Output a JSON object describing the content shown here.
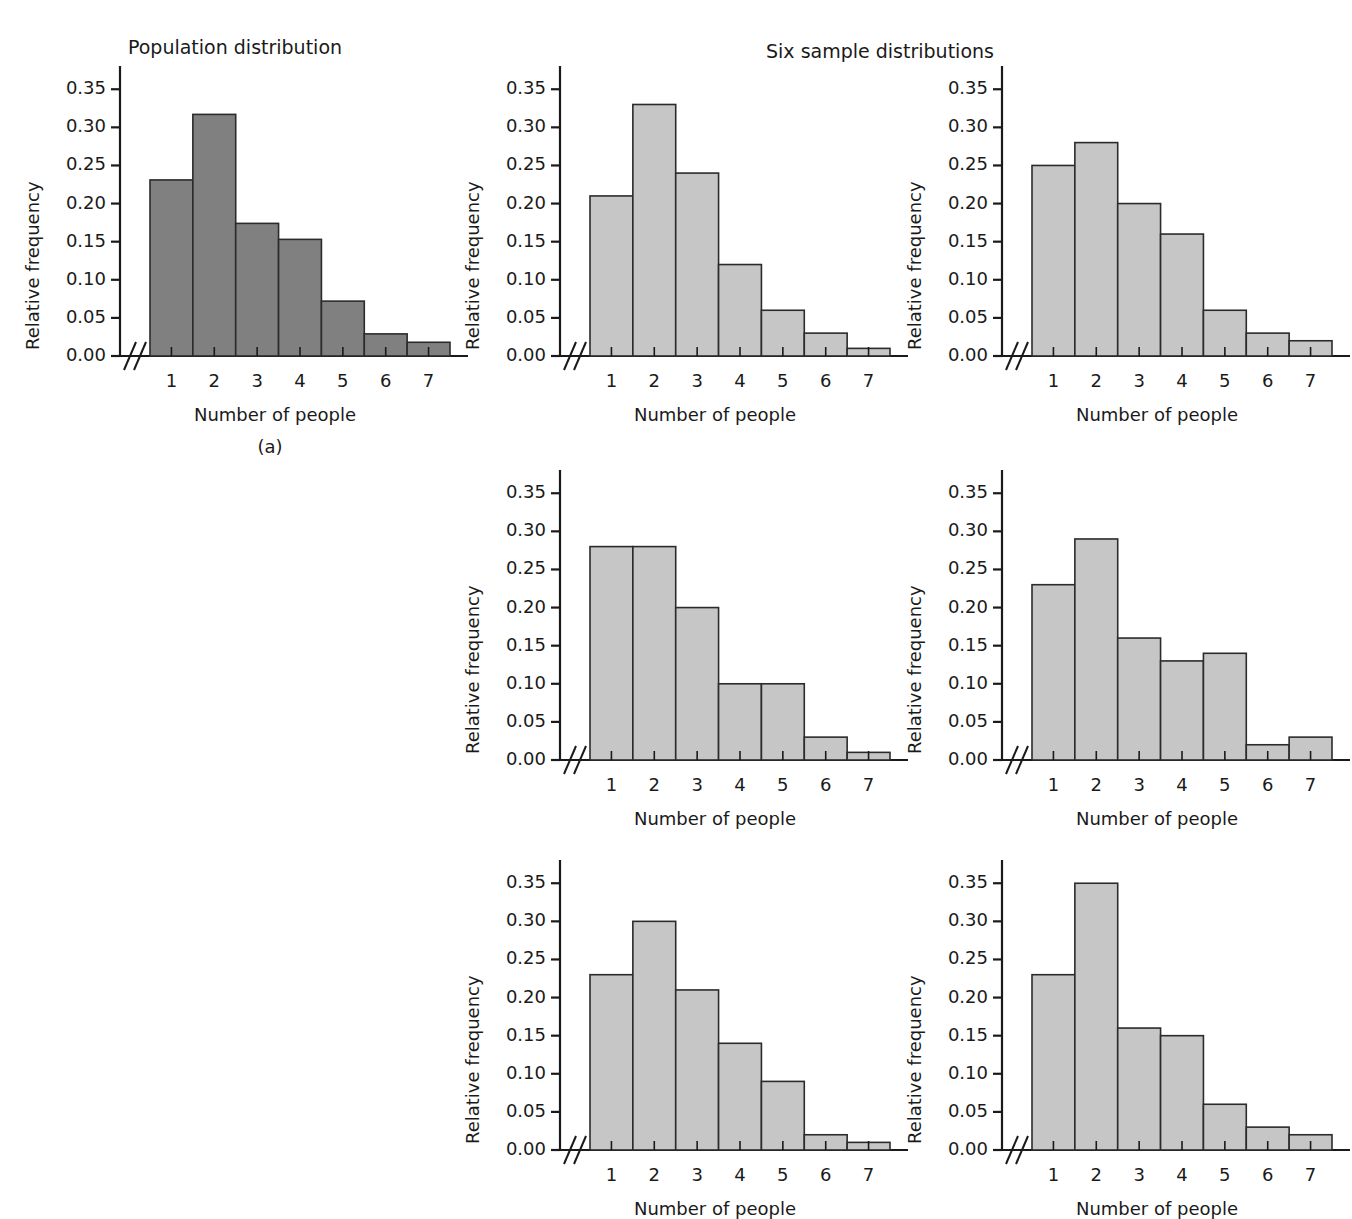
{
  "figure": {
    "caption_a": "(a)",
    "population_title": "Population distribution",
    "samples_title": "Six sample distributions"
  },
  "axis": {
    "xlabel": "Number of people",
    "ylabel": "Relative frequency",
    "ytick_labels": [
      "0.00",
      "0.05",
      "0.10",
      "0.15",
      "0.20",
      "0.25",
      "0.30",
      "0.35"
    ],
    "xtick_labels": [
      "1",
      "2",
      "3",
      "4",
      "5",
      "6",
      "7"
    ]
  },
  "colors": {
    "population_bar_fill": "#808080",
    "sample_bar_fill": "#c6c6c6",
    "bar_stroke": "#2b2b2b",
    "axis": "#1a1a1a",
    "text": "#1a1a1a"
  },
  "chart_data": [
    {
      "type": "bar",
      "name": "population-distribution",
      "title": "Population distribution",
      "xlabel": "Number of people",
      "ylabel": "Relative frequency",
      "categories": [
        "1",
        "2",
        "3",
        "4",
        "5",
        "6",
        "7"
      ],
      "values": [
        0.231,
        0.317,
        0.174,
        0.153,
        0.072,
        0.029,
        0.018
      ],
      "ylim": [
        0.0,
        0.37
      ],
      "yticks": [
        0.0,
        0.05,
        0.1,
        0.15,
        0.2,
        0.25,
        0.3,
        0.35
      ],
      "grid": false,
      "legend": "none",
      "axis_break": true,
      "bar_fill": "#808080"
    },
    {
      "type": "bar",
      "name": "sample-distribution-1",
      "title": "Six sample distributions",
      "xlabel": "Number of people",
      "ylabel": "Relative frequency",
      "categories": [
        "1",
        "2",
        "3",
        "4",
        "5",
        "6",
        "7"
      ],
      "values": [
        0.21,
        0.33,
        0.24,
        0.12,
        0.06,
        0.03,
        0.01
      ],
      "ylim": [
        0.0,
        0.37
      ],
      "yticks": [
        0.0,
        0.05,
        0.1,
        0.15,
        0.2,
        0.25,
        0.3,
        0.35
      ],
      "grid": false,
      "legend": "none",
      "axis_break": true,
      "bar_fill": "#c6c6c6"
    },
    {
      "type": "bar",
      "name": "sample-distribution-2",
      "title": "",
      "xlabel": "Number of people",
      "ylabel": "Relative frequency",
      "categories": [
        "1",
        "2",
        "3",
        "4",
        "5",
        "6",
        "7"
      ],
      "values": [
        0.25,
        0.28,
        0.2,
        0.16,
        0.06,
        0.03,
        0.02
      ],
      "ylim": [
        0.0,
        0.37
      ],
      "yticks": [
        0.0,
        0.05,
        0.1,
        0.15,
        0.2,
        0.25,
        0.3,
        0.35
      ],
      "grid": false,
      "legend": "none",
      "axis_break": true,
      "bar_fill": "#c6c6c6"
    },
    {
      "type": "bar",
      "name": "sample-distribution-3",
      "title": "",
      "xlabel": "Number of people",
      "ylabel": "Relative frequency",
      "categories": [
        "1",
        "2",
        "3",
        "4",
        "5",
        "6",
        "7"
      ],
      "values": [
        0.28,
        0.28,
        0.2,
        0.1,
        0.1,
        0.03,
        0.01
      ],
      "ylim": [
        0.0,
        0.37
      ],
      "yticks": [
        0.0,
        0.05,
        0.1,
        0.15,
        0.2,
        0.25,
        0.3,
        0.35
      ],
      "grid": false,
      "legend": "none",
      "axis_break": true,
      "bar_fill": "#c6c6c6"
    },
    {
      "type": "bar",
      "name": "sample-distribution-4",
      "title": "",
      "xlabel": "Number of people",
      "ylabel": "Relative frequency",
      "categories": [
        "1",
        "2",
        "3",
        "4",
        "5",
        "6",
        "7"
      ],
      "values": [
        0.23,
        0.29,
        0.16,
        0.13,
        0.14,
        0.02,
        0.03
      ],
      "ylim": [
        0.0,
        0.37
      ],
      "yticks": [
        0.0,
        0.05,
        0.1,
        0.15,
        0.2,
        0.25,
        0.3,
        0.35
      ],
      "grid": false,
      "legend": "none",
      "axis_break": true,
      "bar_fill": "#c6c6c6"
    },
    {
      "type": "bar",
      "name": "sample-distribution-5",
      "title": "",
      "xlabel": "Number of people",
      "ylabel": "Relative frequency",
      "categories": [
        "1",
        "2",
        "3",
        "4",
        "5",
        "6",
        "7"
      ],
      "values": [
        0.23,
        0.3,
        0.21,
        0.14,
        0.09,
        0.02,
        0.01
      ],
      "ylim": [
        0.0,
        0.37
      ],
      "yticks": [
        0.0,
        0.05,
        0.1,
        0.15,
        0.2,
        0.25,
        0.3,
        0.35
      ],
      "grid": false,
      "legend": "none",
      "axis_break": true,
      "bar_fill": "#c6c6c6"
    },
    {
      "type": "bar",
      "name": "sample-distribution-6",
      "title": "",
      "xlabel": "Number of people",
      "ylabel": "Relative frequency",
      "categories": [
        "1",
        "2",
        "3",
        "4",
        "5",
        "6",
        "7"
      ],
      "values": [
        0.23,
        0.35,
        0.16,
        0.15,
        0.06,
        0.03,
        0.02
      ],
      "ylim": [
        0.0,
        0.37
      ],
      "yticks": [
        0.0,
        0.05,
        0.1,
        0.15,
        0.2,
        0.25,
        0.3,
        0.35
      ],
      "grid": false,
      "legend": "none",
      "axis_break": true,
      "bar_fill": "#c6c6c6"
    }
  ],
  "layout": {
    "panels": [
      {
        "chart_index": 0,
        "left": 0,
        "top": 36,
        "width": 470,
        "height": 400
      },
      {
        "chart_index": 1,
        "left": 440,
        "top": 36,
        "width": 470,
        "height": 400
      },
      {
        "chart_index": 2,
        "left": 882,
        "top": 36,
        "width": 452,
        "height": 400
      },
      {
        "chart_index": 3,
        "left": 440,
        "top": 440,
        "width": 470,
        "height": 400
      },
      {
        "chart_index": 4,
        "left": 882,
        "top": 440,
        "width": 452,
        "height": 400
      },
      {
        "chart_index": 5,
        "left": 440,
        "top": 830,
        "width": 470,
        "height": 400
      },
      {
        "chart_index": 6,
        "left": 882,
        "top": 830,
        "width": 452,
        "height": 400
      }
    ]
  }
}
